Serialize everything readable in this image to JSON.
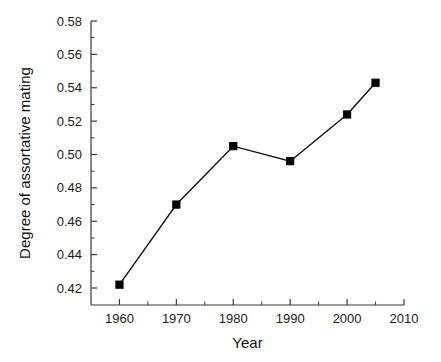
{
  "chart_data": {
    "type": "line",
    "title": "",
    "xlabel": "Year",
    "ylabel": "Degree of assortative mating",
    "x": [
      1960,
      1970,
      1980,
      1990,
      2000,
      2005
    ],
    "values": [
      0.422,
      0.47,
      0.505,
      0.496,
      0.524,
      0.543
    ],
    "series": [
      {
        "name": "Degree of assortative mating",
        "values": [
          0.422,
          0.47,
          0.505,
          0.496,
          0.524,
          0.543
        ]
      }
    ],
    "xlim": [
      1955,
      2010
    ],
    "ylim": [
      0.41,
      0.585
    ],
    "xticks": [
      1960,
      1970,
      1980,
      1990,
      2000,
      2010
    ],
    "xtick_labels": [
      "1960",
      "1970",
      "1980",
      "1990",
      "2000",
      "2010"
    ],
    "x_minor_ticks": [
      1965,
      1975,
      1985,
      1995,
      2005
    ],
    "yticks": [
      0.42,
      0.44,
      0.46,
      0.48,
      0.5,
      0.52,
      0.54,
      0.56,
      0.58
    ],
    "ytick_labels": [
      "0.42",
      "0.44",
      "0.46",
      "0.48",
      "0.50",
      "0.52",
      "0.54",
      "0.56",
      "0.58"
    ],
    "y_minor_ticks": [
      0.43,
      0.45,
      0.47,
      0.49,
      0.51,
      0.53,
      0.55,
      0.57
    ],
    "grid": false,
    "legend": false,
    "marker": "square",
    "line_color": "#111111",
    "marker_color": "#000000",
    "axis_color": "#3a3a3a",
    "background": "#ffffff"
  }
}
